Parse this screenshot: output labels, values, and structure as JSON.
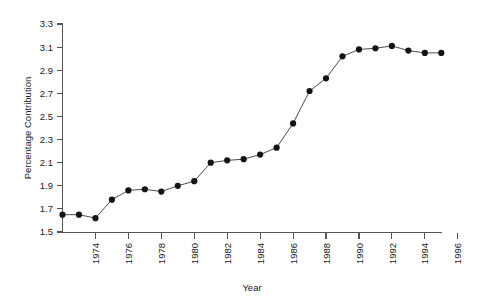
{
  "chart_data": {
    "type": "line",
    "title": "",
    "xlabel": "Year",
    "ylabel": "Percentage Contribution",
    "xlim": [
      1971,
      1997
    ],
    "ylim": [
      1.5,
      3.3
    ],
    "grid": false,
    "legend": null,
    "marker": "filled-circle",
    "x_tick_labels": [
      "1974",
      "1976",
      "1978",
      "1980",
      "1982",
      "1984",
      "1986",
      "1988",
      "1990",
      "1992",
      "1994",
      "1996"
    ],
    "x_tick_values": [
      1974,
      1976,
      1978,
      1980,
      1982,
      1984,
      1986,
      1988,
      1990,
      1992,
      1994,
      1996
    ],
    "x_tick_rotation": 90,
    "y_tick_labels": [
      "1.5",
      "1.7",
      "1.9",
      "2.1",
      "2.3",
      "2.5",
      "2.7",
      "2.9",
      "3.1",
      "3.3"
    ],
    "y_tick_values": [
      1.5,
      1.7,
      1.9,
      2.1,
      2.3,
      2.5,
      2.7,
      2.9,
      3.1,
      3.3
    ],
    "x": [
      1972,
      1973,
      1974,
      1975,
      1976,
      1977,
      1978,
      1979,
      1980,
      1981,
      1982,
      1983,
      1984,
      1985,
      1986,
      1987,
      1988,
      1989,
      1990,
      1991,
      1992,
      1993,
      1994,
      1995
    ],
    "values": [
      1.65,
      1.65,
      1.62,
      1.78,
      1.86,
      1.87,
      1.85,
      1.9,
      1.94,
      2.1,
      2.12,
      2.13,
      2.17,
      2.23,
      2.44,
      2.72,
      2.83,
      3.02,
      3.08,
      3.09,
      3.11,
      3.07,
      3.05,
      3.05
    ],
    "series": [
      {
        "name": "Percentage Contribution",
        "values": [
          1.65,
          1.65,
          1.62,
          1.78,
          1.86,
          1.87,
          1.85,
          1.9,
          1.94,
          2.1,
          2.12,
          2.13,
          2.17,
          2.23,
          2.44,
          2.72,
          2.83,
          3.02,
          3.08,
          3.09,
          3.11,
          3.07,
          3.05,
          3.05
        ],
        "color": "#4d4d4d",
        "marker_color": "#141414"
      }
    ]
  },
  "axes": {
    "y_title": "Percentage Contribution",
    "x_title": "Year"
  },
  "colors": {
    "background": "#ffffff",
    "axis": "#555555",
    "line": "#4d4d4d",
    "marker": "#141414",
    "text": "#1a1a1a"
  }
}
